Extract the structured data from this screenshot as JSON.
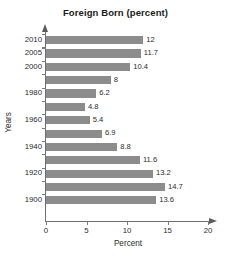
{
  "chart_data": {
    "type": "bar",
    "orientation": "horizontal",
    "title": "Foreign Born (percent)",
    "xlabel": "Percent",
    "ylabel": "Years",
    "categories": [
      "2010",
      "2005",
      "2000",
      "",
      "1980",
      "",
      "1960",
      "",
      "1940",
      "",
      "1920",
      "",
      "1900"
    ],
    "values": [
      12,
      11.7,
      10.4,
      8,
      6.2,
      4.8,
      5.4,
      6.9,
      8.8,
      11.6,
      13.2,
      14.7,
      13.6
    ],
    "value_labels": [
      "12",
      "11.7",
      "10.4",
      "8",
      "6.2",
      "4.8",
      "5.4",
      "6.9",
      "8.8",
      "11.6",
      "13.2",
      "14.7",
      "13.6"
    ],
    "xlim": [
      0,
      20
    ],
    "xticks": [
      0,
      5,
      10,
      15,
      20
    ],
    "xtick_labels": [
      "0",
      "5",
      "10",
      "15",
      "20"
    ],
    "grid": false,
    "legend": false,
    "bar_color": "#8c8c8c",
    "axis_color": "#6d6e71",
    "text_color": "#2b2b2b"
  }
}
